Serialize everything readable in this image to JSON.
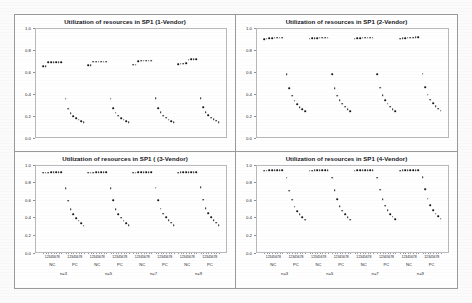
{
  "figure": {
    "panel_layout": "2x2",
    "background": "#ffffff",
    "frame_color": "#9a9a9a",
    "dot_color": "#16161a"
  },
  "chart_data": [
    {
      "type": "scatter",
      "title": "Utilization of resources in SP1 (1-Vendor)",
      "xlabel": "",
      "ylabel": "",
      "ylim": [
        0.0,
        1.0
      ],
      "ytick_labels": [
        "1.0",
        "0.8",
        "0.6",
        "0.4",
        "0.2",
        "0.0"
      ],
      "ytick_values": [
        1.0,
        0.8,
        0.6,
        0.4,
        0.2,
        0.0
      ],
      "grid": false,
      "legend": "none",
      "x_tick_labels": [
        "1",
        "2",
        "3",
        "4",
        "5",
        "6",
        "7",
        "8"
      ],
      "group_labels": [
        "NC",
        "PC"
      ],
      "section_labels": [
        "n=3",
        "n=5",
        "n=7",
        "n=9"
      ],
      "series": [
        {
          "name": "n=3 NC",
          "values": [
            0.655,
            0.655,
            0.688,
            0.69,
            0.69,
            0.69,
            0.69,
            0.69
          ]
        },
        {
          "name": "n=3 PC",
          "values": [
            0.357,
            0.268,
            0.228,
            0.2,
            0.18,
            0.165,
            0.152,
            0.142
          ]
        },
        {
          "name": "n=5 NC",
          "values": [
            0.662,
            0.662,
            0.692,
            0.693,
            0.694,
            0.694,
            0.694,
            0.694
          ]
        },
        {
          "name": "n=5 PC",
          "values": [
            0.358,
            0.27,
            0.23,
            0.202,
            0.182,
            0.166,
            0.153,
            0.143
          ]
        },
        {
          "name": "n=7 NC",
          "values": [
            0.666,
            0.666,
            0.7,
            0.702,
            0.703,
            0.703,
            0.703,
            0.703
          ]
        },
        {
          "name": "n=7 PC",
          "values": [
            0.362,
            0.272,
            0.232,
            0.204,
            0.184,
            0.168,
            0.155,
            0.145
          ]
        },
        {
          "name": "n=9 NC",
          "values": [
            0.672,
            0.674,
            0.676,
            0.678,
            0.712,
            0.714,
            0.716,
            0.718
          ]
        },
        {
          "name": "n=9 PC",
          "values": [
            0.362,
            0.282,
            0.236,
            0.206,
            0.186,
            0.17,
            0.156,
            0.146
          ]
        }
      ]
    },
    {
      "type": "scatter",
      "title": "Utilization of resources in SP1 (2-Vendor)",
      "xlabel": "",
      "ylabel": "",
      "ylim": [
        0.0,
        1.0
      ],
      "ytick_labels": [
        "1.0",
        "0.8",
        "0.6",
        "0.4",
        "0.2",
        "0.0"
      ],
      "ytick_values": [
        1.0,
        0.8,
        0.6,
        0.4,
        0.2,
        0.0
      ],
      "grid": false,
      "legend": "none",
      "x_tick_labels": [
        "1",
        "2",
        "3",
        "4",
        "5",
        "6",
        "7",
        "8"
      ],
      "group_labels": [
        "NC",
        "PC"
      ],
      "section_labels": [
        "n=3",
        "n=5",
        "n=7",
        "n=9"
      ],
      "series": [
        {
          "name": "n=3 NC",
          "values": [
            0.9,
            0.903,
            0.906,
            0.908,
            0.91,
            0.91,
            0.911,
            0.911
          ]
        },
        {
          "name": "n=3 PC",
          "values": [
            0.578,
            0.452,
            0.384,
            0.34,
            0.308,
            0.282,
            0.262,
            0.243
          ]
        },
        {
          "name": "n=5 NC",
          "values": [
            0.902,
            0.905,
            0.907,
            0.909,
            0.911,
            0.911,
            0.912,
            0.912
          ]
        },
        {
          "name": "n=5 PC",
          "values": [
            0.58,
            0.454,
            0.386,
            0.342,
            0.31,
            0.284,
            0.263,
            0.244
          ]
        },
        {
          "name": "n=7 NC",
          "values": [
            0.903,
            0.906,
            0.908,
            0.91,
            0.912,
            0.912,
            0.913,
            0.913
          ]
        },
        {
          "name": "n=7 PC",
          "values": [
            0.582,
            0.456,
            0.388,
            0.344,
            0.312,
            0.286,
            0.264,
            0.245
          ]
        },
        {
          "name": "n=9 NC",
          "values": [
            0.904,
            0.907,
            0.909,
            0.911,
            0.913,
            0.913,
            0.914,
            0.914
          ]
        },
        {
          "name": "n=9 PC",
          "values": [
            0.586,
            0.46,
            0.392,
            0.348,
            0.316,
            0.29,
            0.268,
            0.248
          ]
        }
      ]
    },
    {
      "type": "scatter",
      "title": "Utilization of resources in SP1 ( (3-Vendor)",
      "xlabel": "",
      "ylabel": "",
      "ylim": [
        0.0,
        1.0
      ],
      "ytick_labels": [
        "1.0",
        "0.8",
        "0.6",
        "0.4",
        "0.2",
        "0.0"
      ],
      "ytick_values": [
        1.0,
        0.8,
        0.6,
        0.4,
        0.2,
        0.0
      ],
      "grid": false,
      "legend": "none",
      "x_tick_labels": [
        "1",
        "2",
        "3",
        "4",
        "5",
        "6",
        "7",
        "8"
      ],
      "group_labels": [
        "NC",
        "PC"
      ],
      "section_labels": [
        "n=3",
        "n=5",
        "n=7",
        "n=9"
      ],
      "series": [
        {
          "name": "n=3 NC",
          "values": [
            0.905,
            0.907,
            0.909,
            0.91,
            0.911,
            0.912,
            0.912,
            0.913
          ]
        },
        {
          "name": "n=3 PC",
          "values": [
            0.73,
            0.59,
            0.492,
            0.434,
            0.393,
            0.36,
            0.333,
            0.305
          ]
        },
        {
          "name": "n=5 NC",
          "values": [
            0.906,
            0.908,
            0.909,
            0.911,
            0.912,
            0.912,
            0.913,
            0.913
          ]
        },
        {
          "name": "n=5 PC",
          "values": [
            0.732,
            0.592,
            0.494,
            0.436,
            0.395,
            0.362,
            0.335,
            0.307
          ]
        },
        {
          "name": "n=7 NC",
          "values": [
            0.907,
            0.909,
            0.91,
            0.912,
            0.913,
            0.913,
            0.914,
            0.914
          ]
        },
        {
          "name": "n=7 PC",
          "values": [
            0.736,
            0.596,
            0.498,
            0.44,
            0.398,
            0.365,
            0.338,
            0.309
          ]
        },
        {
          "name": "n=9 NC",
          "values": [
            0.908,
            0.91,
            0.911,
            0.913,
            0.914,
            0.914,
            0.915,
            0.915
          ]
        },
        {
          "name": "n=9 PC",
          "values": [
            0.742,
            0.6,
            0.502,
            0.444,
            0.402,
            0.368,
            0.34,
            0.312
          ]
        }
      ]
    },
    {
      "type": "scatter",
      "title": "Utilization of resources in SP1 (4-Vendor)",
      "xlabel": "",
      "ylabel": "",
      "ylim": [
        0.0,
        1.0
      ],
      "ytick_labels": [
        "1.0",
        "0.8",
        "0.6",
        "0.4",
        "0.2",
        "0.0"
      ],
      "ytick_values": [
        1.0,
        0.8,
        0.6,
        0.4,
        0.2,
        0.0
      ],
      "grid": false,
      "legend": "none",
      "x_tick_labels": [
        "1",
        "2",
        "3",
        "4",
        "5",
        "6",
        "7",
        "8"
      ],
      "group_labels": [
        "NC",
        "PC"
      ],
      "section_labels": [
        "n=3",
        "n=5",
        "n=7",
        "n=9"
      ],
      "series": [
        {
          "name": "n=3 NC",
          "values": [
            0.928,
            0.93,
            0.932,
            0.933,
            0.934,
            0.935,
            0.935,
            0.936
          ]
        },
        {
          "name": "n=3 PC",
          "values": [
            0.848,
            0.702,
            0.601,
            0.522,
            0.47,
            0.432,
            0.4,
            0.372
          ]
        },
        {
          "name": "n=5 NC",
          "values": [
            0.929,
            0.931,
            0.932,
            0.934,
            0.935,
            0.935,
            0.936,
            0.936
          ]
        },
        {
          "name": "n=5 PC",
          "values": [
            0.85,
            0.705,
            0.604,
            0.525,
            0.473,
            0.434,
            0.402,
            0.374
          ]
        },
        {
          "name": "n=7 NC",
          "values": [
            0.93,
            0.932,
            0.933,
            0.935,
            0.936,
            0.936,
            0.937,
            0.937
          ]
        },
        {
          "name": "n=7 PC",
          "values": [
            0.852,
            0.712,
            0.608,
            0.53,
            0.478,
            0.438,
            0.406,
            0.378
          ]
        },
        {
          "name": "n=9 NC",
          "values": [
            0.931,
            0.933,
            0.934,
            0.936,
            0.937,
            0.937,
            0.938,
            0.938
          ]
        },
        {
          "name": "n=9 PC",
          "values": [
            0.854,
            0.716,
            0.612,
            0.535,
            0.482,
            0.442,
            0.41,
            0.382
          ]
        }
      ]
    }
  ]
}
